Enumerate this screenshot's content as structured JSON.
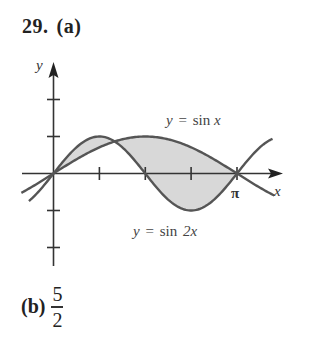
{
  "problem": {
    "number": "29.",
    "part_a_label": "(a)",
    "part_b_label": "(b)",
    "part_b_answer": {
      "numerator": "5",
      "denominator": "2"
    }
  },
  "graph": {
    "x_axis_label": "x",
    "y_axis_label": "y",
    "x_tick_label_pi": "π",
    "curve_1_label": {
      "var": "y",
      "eq": "=",
      "fn": "sin",
      "arg": "x"
    },
    "curve_2_label": {
      "var": "y",
      "eq": "=",
      "fn": "sin",
      "arg": "2x"
    },
    "colors": {
      "curve": "#555555",
      "shade": "#d8d8d8",
      "axis": "#333333"
    }
  },
  "chart_data": {
    "type": "line",
    "title": "",
    "xlabel": "x",
    "ylabel": "y",
    "x_ticks": [
      "π/4",
      "π/2",
      "3π/4",
      "π"
    ],
    "y_ticks": [
      -2,
      -1,
      1,
      2
    ],
    "xlim": [
      -0.55,
      3.9
    ],
    "ylim": [
      -2.5,
      2.5
    ],
    "series": [
      {
        "name": "y = sin x",
        "function": "sin(x)"
      },
      {
        "name": "y = sin 2x",
        "function": "sin(2x)"
      }
    ],
    "shaded_region": "between y = sin x and y = sin 2x for 0 ≤ x ≤ π",
    "intersections": [
      "0",
      "π/3",
      "π"
    ]
  }
}
